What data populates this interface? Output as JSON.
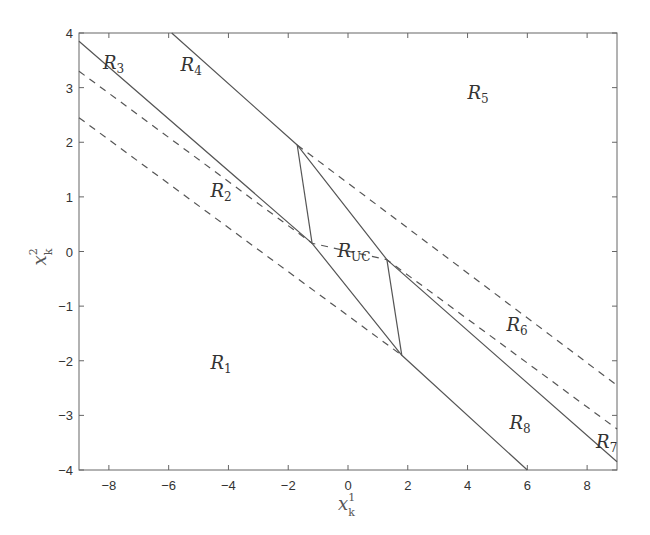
{
  "chart_data": {
    "type": "line",
    "title": "",
    "xlabel": "x_k^1",
    "ylabel": "x_k^2",
    "xlabel_parts": {
      "base": "x",
      "sub": "k",
      "sup": "1"
    },
    "ylabel_parts": {
      "base": "x",
      "sub": "k",
      "sup": "2"
    },
    "xlim": [
      -9,
      9
    ],
    "ylim": [
      -4,
      4
    ],
    "xticks": [
      -8,
      -6,
      -4,
      -2,
      0,
      2,
      4,
      6,
      8
    ],
    "yticks": [
      -4,
      -3,
      -2,
      -1,
      0,
      1,
      2,
      3,
      4
    ],
    "grid": false,
    "legend": null,
    "colors": {
      "line": "#555555",
      "axis": "#666666",
      "text": "#333333"
    },
    "series": [
      {
        "name": "solid-upper-boundary",
        "style": "solid",
        "points": [
          [
            -5.9,
            4.0
          ],
          [
            -1.7,
            1.95
          ],
          [
            1.3,
            -0.15
          ],
          [
            9.0,
            -3.85
          ]
        ]
      },
      {
        "name": "solid-lower-boundary",
        "style": "solid",
        "points": [
          [
            -9.0,
            3.85
          ],
          [
            -1.2,
            0.15
          ],
          [
            1.8,
            -1.9
          ],
          [
            6.0,
            -4.0
          ]
        ]
      },
      {
        "name": "solid-connector-left",
        "style": "solid",
        "points": [
          [
            -1.7,
            1.95
          ],
          [
            -1.2,
            0.15
          ]
        ]
      },
      {
        "name": "solid-connector-right",
        "style": "solid",
        "points": [
          [
            1.3,
            -0.15
          ],
          [
            1.8,
            -1.9
          ]
        ]
      },
      {
        "name": "dashed-upper-right",
        "style": "dashed",
        "points": [
          [
            -1.7,
            1.95
          ],
          [
            9.0,
            -2.45
          ]
        ]
      },
      {
        "name": "dashed-middle",
        "style": "dashed",
        "points": [
          [
            -9.0,
            3.3
          ],
          [
            -1.2,
            0.15
          ],
          [
            1.3,
            -0.15
          ],
          [
            9.0,
            -3.25
          ]
        ]
      },
      {
        "name": "dashed-lower-left",
        "style": "dashed",
        "points": [
          [
            -9.0,
            2.45
          ],
          [
            1.8,
            -1.9
          ]
        ]
      }
    ],
    "annotations": [
      {
        "text": "R_3",
        "base": "R",
        "sub": "3",
        "x": -8.2,
        "y": 3.35
      },
      {
        "text": "R_4",
        "base": "R",
        "sub": "4",
        "x": -5.6,
        "y": 3.3
      },
      {
        "text": "R_5",
        "base": "R",
        "sub": "5",
        "x": 4.0,
        "y": 2.8
      },
      {
        "text": "R_2",
        "base": "R",
        "sub": "2",
        "x": -4.6,
        "y": 1.0
      },
      {
        "text": "R_UC",
        "base": "R",
        "sub": "UC",
        "x": -0.35,
        "y": -0.1
      },
      {
        "text": "R_6",
        "base": "R",
        "sub": "6",
        "x": 5.3,
        "y": -1.45
      },
      {
        "text": "R_1",
        "base": "R",
        "sub": "1",
        "x": -4.6,
        "y": -2.15
      },
      {
        "text": "R_8",
        "base": "R",
        "sub": "8",
        "x": 5.4,
        "y": -3.25
      },
      {
        "text": "R_7",
        "base": "R",
        "sub": "7",
        "x": 8.3,
        "y": -3.6
      }
    ]
  }
}
